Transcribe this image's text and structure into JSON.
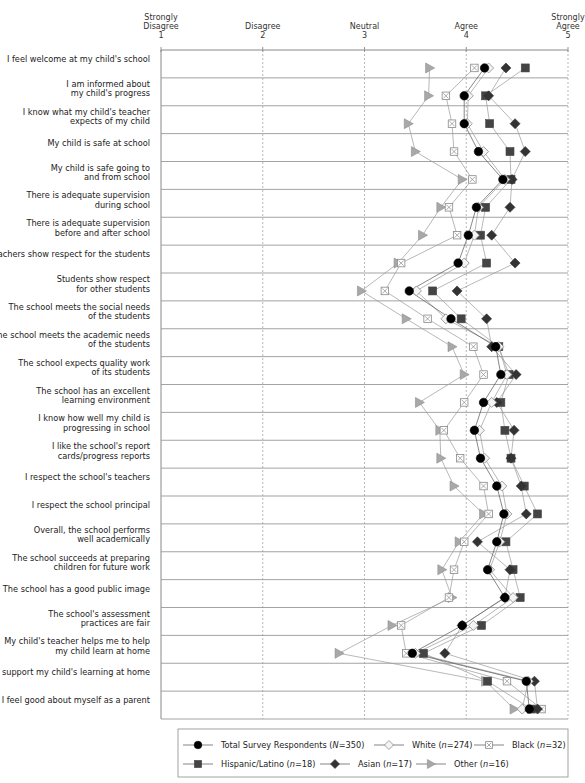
{
  "chart_data": {
    "type": "scatter",
    "subtype": "dot-plot with connecting lines (one line per series)",
    "title": "",
    "xlabel": "",
    "ylabel": "",
    "xlim": [
      1,
      5
    ],
    "x_ticks": [
      {
        "value": 1,
        "label": [
          "Strongly",
          "Disagree",
          "1"
        ]
      },
      {
        "value": 2,
        "label": [
          "Disagree",
          "2"
        ]
      },
      {
        "value": 3,
        "label": [
          "Neutral",
          "3"
        ]
      },
      {
        "value": 4,
        "label": [
          "Agree",
          "4"
        ]
      },
      {
        "value": 5,
        "label": [
          "Strongly",
          "Agree",
          "5"
        ]
      }
    ],
    "grid": "vertical dashed at 2,3,4,5; horizontal solid row separators",
    "legend_position": "bottom",
    "categories": [
      [
        "I feel welcome at my child's school"
      ],
      [
        "I am informed about",
        "my child's progress"
      ],
      [
        "I know what my child's teacher",
        "expects of my child"
      ],
      [
        "My child is safe at school"
      ],
      [
        "My child is safe going to",
        "and from school"
      ],
      [
        "There is adequate supervision",
        "during school"
      ],
      [
        "There is adequate supervision",
        "before and after school"
      ],
      [
        "Teachers show respect for the students"
      ],
      [
        "Students show respect",
        "for other students"
      ],
      [
        "The school meets the social needs",
        "of the students"
      ],
      [
        "The school meets the academic needs",
        "of the students"
      ],
      [
        "The school expects quality work",
        "of its students"
      ],
      [
        "The school has an excellent",
        "learning environment"
      ],
      [
        "I know how well my child is",
        "progressing in school"
      ],
      [
        "I like the school's report",
        "cards/progress reports"
      ],
      [
        "I respect the school's teachers"
      ],
      [
        "I respect the school principal"
      ],
      [
        "Overall, the school performs",
        "well academically"
      ],
      [
        "The school succeeds at preparing",
        "children for future work"
      ],
      [
        "The school has a good public image"
      ],
      [
        "The school's assessment",
        "practices are fair"
      ],
      [
        "My child's teacher helps me to help",
        "my child learn at home"
      ],
      [
        "I support my child's learning at home"
      ],
      [
        "I feel good about myself as a parent"
      ]
    ],
    "series": [
      {
        "name": "Other (n=16)",
        "legend": [
          "Other (",
          "n",
          "=16)"
        ],
        "marker": "triangle",
        "color": "#9a9a9a",
        "values": [
          3.64,
          3.63,
          3.43,
          3.5,
          3.96,
          3.75,
          3.57,
          3.33,
          2.97,
          3.41,
          3.86,
          3.98,
          3.54,
          3.74,
          3.75,
          3.88,
          4.17,
          3.93,
          3.76,
          3.86,
          3.27,
          2.75,
          4.19,
          4.47
        ]
      },
      {
        "name": "Black (n=32)",
        "legend": [
          "Black (",
          "n",
          "=32)"
        ],
        "marker": "square-x",
        "color": "#8a8a8a",
        "values": [
          4.08,
          3.8,
          3.86,
          3.88,
          4.06,
          3.83,
          3.91,
          3.36,
          3.2,
          3.62,
          4.07,
          4.17,
          3.98,
          3.78,
          3.94,
          4.17,
          4.22,
          3.98,
          3.88,
          3.83,
          3.36,
          3.41,
          4.4,
          4.74
        ]
      },
      {
        "name": "Hispanic/Latino (n=18)",
        "legend": [
          "Hispanic/Latino (",
          "n",
          "=18)"
        ],
        "marker": "square",
        "color": "#444444",
        "values": [
          4.58,
          4.19,
          4.23,
          4.43,
          4.44,
          4.19,
          4.14,
          4.2,
          3.67,
          3.95,
          4.32,
          4.42,
          4.34,
          4.38,
          4.44,
          4.57,
          4.7,
          4.39,
          4.46,
          4.53,
          4.15,
          3.58,
          4.21,
          4.64
        ]
      },
      {
        "name": "Asian (n=17)",
        "legend": [
          "Asian (",
          "n",
          "=17)"
        ],
        "marker": "diamond-filled",
        "color": "#333333",
        "values": [
          4.39,
          4.22,
          4.48,
          4.58,
          4.45,
          4.43,
          4.25,
          4.48,
          3.91,
          4.2,
          4.25,
          4.49,
          4.3,
          4.47,
          4.44,
          4.54,
          4.59,
          4.11,
          4.43,
          4.38,
          3.96,
          3.79,
          4.67,
          4.7
        ]
      },
      {
        "name": "White (n=274)",
        "legend": [
          "White (",
          "n",
          "=274)"
        ],
        "marker": "diamond-open",
        "color": "#9a9a9a",
        "values": [
          4.22,
          4.02,
          4.01,
          4.17,
          4.38,
          4.12,
          4.08,
          3.98,
          3.51,
          3.8,
          4.32,
          4.4,
          4.25,
          4.13,
          4.18,
          4.35,
          4.4,
          4.33,
          4.23,
          4.46,
          4.07,
          3.5,
          4.61,
          4.55
        ]
      },
      {
        "name": "Total Survey Respondents (N=350)",
        "legend": [
          "Total Survey Respondents (",
          "N",
          "=350)"
        ],
        "marker": "circle",
        "color": "#000000",
        "values": [
          4.18,
          3.98,
          3.98,
          4.12,
          4.36,
          4.1,
          4.02,
          3.92,
          3.44,
          3.85,
          4.29,
          4.34,
          4.17,
          4.08,
          4.14,
          4.3,
          4.37,
          4.3,
          4.21,
          4.38,
          3.96,
          3.47,
          4.59,
          4.62
        ]
      }
    ],
    "legend_order": [
      [
        "Total Survey Respondents (N=350)",
        "White (n=274)",
        "Black (n=32)"
      ],
      [
        "Hispanic/Latino (n=18)",
        "Asian (n=17)",
        "Other (n=16)"
      ]
    ]
  }
}
